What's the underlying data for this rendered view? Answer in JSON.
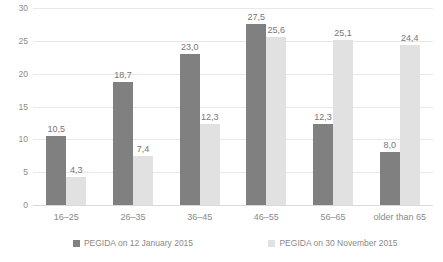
{
  "chart_data": {
    "type": "bar",
    "title": "",
    "subtitle": "",
    "xlabel": "",
    "ylabel": "",
    "ylim": [
      0,
      30
    ],
    "yticks": [
      "0",
      "5",
      "10",
      "15",
      "20",
      "25",
      "30"
    ],
    "ytick_values": [
      0,
      5,
      10,
      15,
      20,
      25,
      30
    ],
    "grid": true,
    "legend_position": "bottom",
    "decimal_separator": ",",
    "categories": [
      "16–25",
      "26–35",
      "36–45",
      "46–55",
      "56–65",
      "older than 65"
    ],
    "series": [
      {
        "name": "PEGIDA on 12 January 2015",
        "color": "#808080",
        "values": [
          10.5,
          18.7,
          23.0,
          27.5,
          12.3,
          8.0
        ],
        "labels": [
          "10,5",
          "18,7",
          "23,0",
          "27,5",
          "12,3",
          "8,0"
        ]
      },
      {
        "name": "PEGIDA on 30 November 2015",
        "color": "#e1e1e1",
        "values": [
          4.3,
          7.4,
          12.3,
          25.6,
          25.1,
          24.4
        ],
        "labels": [
          "4,3",
          "7,4",
          "12,3",
          "25,6",
          "25,1",
          "24,4"
        ]
      }
    ]
  },
  "legend": {
    "items": [
      {
        "label": "PEGIDA on 12 January 2015",
        "color": "#808080"
      },
      {
        "label": "PEGIDA on 30 November 2015",
        "color": "#e1e1e1"
      }
    ]
  },
  "colors": {
    "series_a": "#808080",
    "series_b": "#e1e1e1",
    "gridline": "#e8e8e8",
    "text": "#8a8a8a",
    "background": "#ffffff"
  }
}
